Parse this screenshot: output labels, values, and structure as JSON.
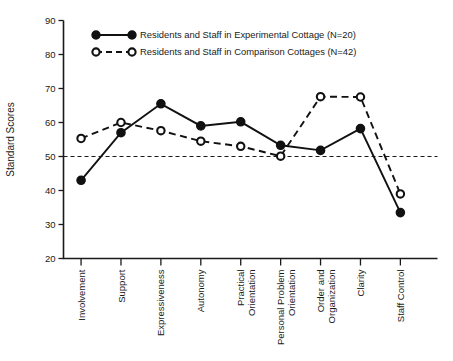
{
  "chart_data": {
    "type": "line",
    "title": "",
    "xlabel": "",
    "ylabel": "Standard Scores",
    "ylim": [
      20,
      90
    ],
    "ytick_values": [
      20,
      30,
      40,
      50,
      60,
      70,
      80,
      90
    ],
    "ytick_labels": [
      "20",
      "30",
      "40",
      "50",
      "60",
      "70",
      "80",
      "90"
    ],
    "grid": false,
    "legend_position": "top-left-inside",
    "reference_line": {
      "value": 50,
      "style": "dashed",
      "label": ""
    },
    "categories": [
      "Involvement",
      "Support",
      "Expressiveness",
      "Autonomy",
      "Practical\nOrientation",
      "Personal Problem\nOrientation",
      "Order and\nOrganization",
      "Clarity",
      "Staff Control"
    ],
    "category_lines": [
      [
        "Involvement"
      ],
      [
        "Support"
      ],
      [
        "Expressiveness"
      ],
      [
        "Autonomy"
      ],
      [
        "Practical",
        "Orientation"
      ],
      [
        "Personal Problem",
        "Orientation"
      ],
      [
        "Order and",
        "Organization"
      ],
      [
        "Clarity"
      ],
      [
        "Staff Control"
      ]
    ],
    "series": [
      {
        "name": "Residents and Staff in Experimental Cottage (N=20)",
        "marker": "filled-circle",
        "line": "solid",
        "color": "#111111",
        "n": 20,
        "values": [
          43.0,
          57.0,
          65.5,
          59.0,
          60.2,
          53.3,
          51.8,
          58.2,
          33.5
        ]
      },
      {
        "name": "Residents and Staff in Comparison Cottages  (N=42)",
        "marker": "open-circle",
        "line": "dashed",
        "color": "#111111",
        "n": 42,
        "values": [
          55.3,
          60.0,
          57.6,
          54.5,
          53.0,
          50.1,
          67.6,
          67.5,
          39.0
        ]
      }
    ]
  },
  "legend": {
    "items": [
      {
        "label": "Residents and Staff in Experimental Cottage (N=20)",
        "style": "solid-filled"
      },
      {
        "label": "Residents and Staff in Comparison Cottages  (N=42)",
        "style": "dashed-open"
      }
    ]
  }
}
